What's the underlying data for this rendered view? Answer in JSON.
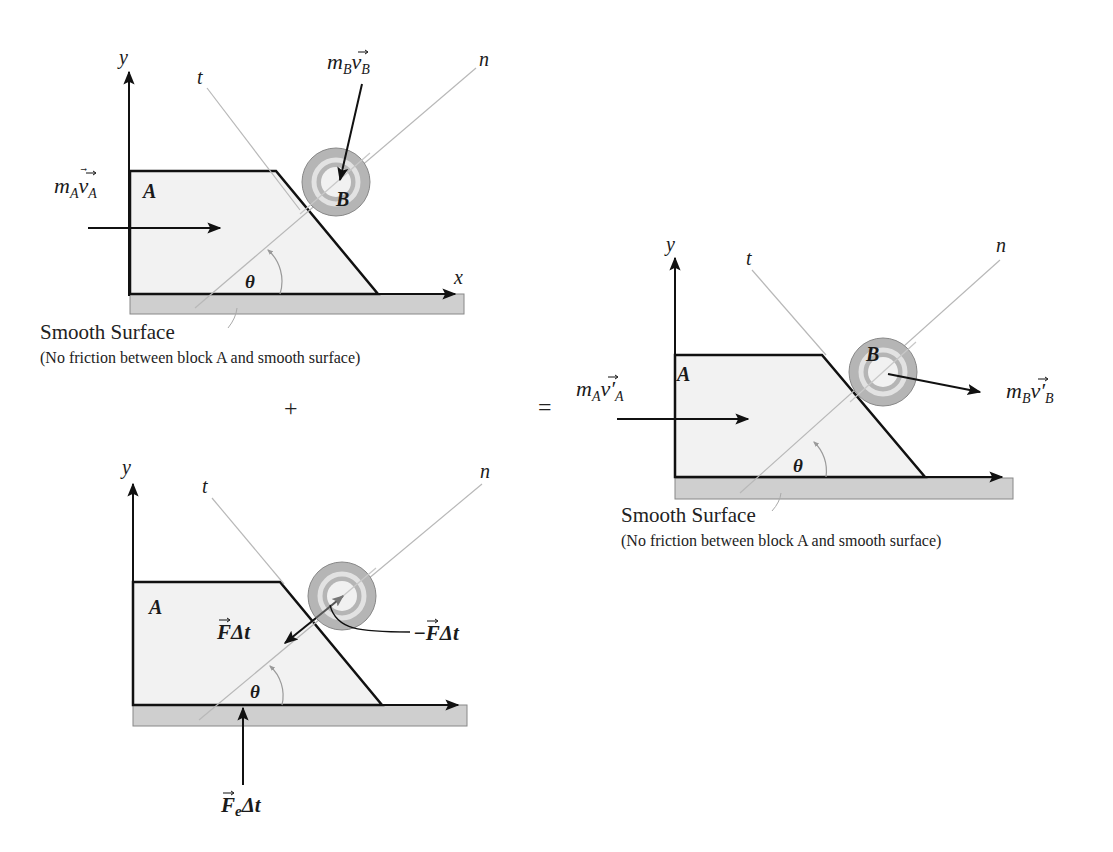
{
  "colors": {
    "outline": "#111111",
    "block_fill": "#f2f2f2",
    "ground_fill": "#cfcfcf",
    "ground_stroke": "#888888",
    "guide_line": "#b8b8b8",
    "ball_outer": "#b5b5b5",
    "ball_ring": "#e2e2e2",
    "ball_inner": "#f1f1f1",
    "angle_arc": "#9a9a9a"
  },
  "operators": {
    "plus": "+",
    "equals": "="
  },
  "panels": {
    "before": {
      "axis_y": "y",
      "axis_x": "x",
      "axis_t": "t",
      "axis_n": "n",
      "block_label": "A",
      "ball_label": "B",
      "angle_label": "θ",
      "momentum_A": {
        "m": "m",
        "m_sub": "A",
        "v": "v",
        "v_sub": "A",
        "prime": ""
      },
      "momentum_B": {
        "m": "m",
        "m_sub": "B",
        "v": "v",
        "v_sub": "B",
        "prime": ""
      },
      "surface_label": "Smooth Surface",
      "surface_note": "(No friction between block A and smooth surface)"
    },
    "impulse": {
      "axis_y": "y",
      "axis_t": "t",
      "axis_n": "n",
      "block_label": "A",
      "angle_label": "θ",
      "impulse_on_A": {
        "F": "F",
        "rest": "Δt"
      },
      "impulse_on_B": {
        "sign": "−",
        "F": "F",
        "rest": "Δt"
      },
      "external_impulse": {
        "F": "F",
        "sub": "e",
        "rest": "Δt"
      }
    },
    "after": {
      "axis_y": "y",
      "axis_t": "t",
      "axis_n": "n",
      "block_label": "A",
      "ball_label": "B",
      "angle_label": "θ",
      "momentum_A": {
        "m": "m",
        "m_sub": "A",
        "v": "v",
        "prime": "′",
        "v_sub": "A"
      },
      "momentum_B": {
        "m": "m",
        "m_sub": "B",
        "v": "v",
        "prime": "′",
        "v_sub": "B"
      },
      "surface_label": "Smooth Surface",
      "surface_note": "(No friction between block A and smooth surface)"
    }
  }
}
